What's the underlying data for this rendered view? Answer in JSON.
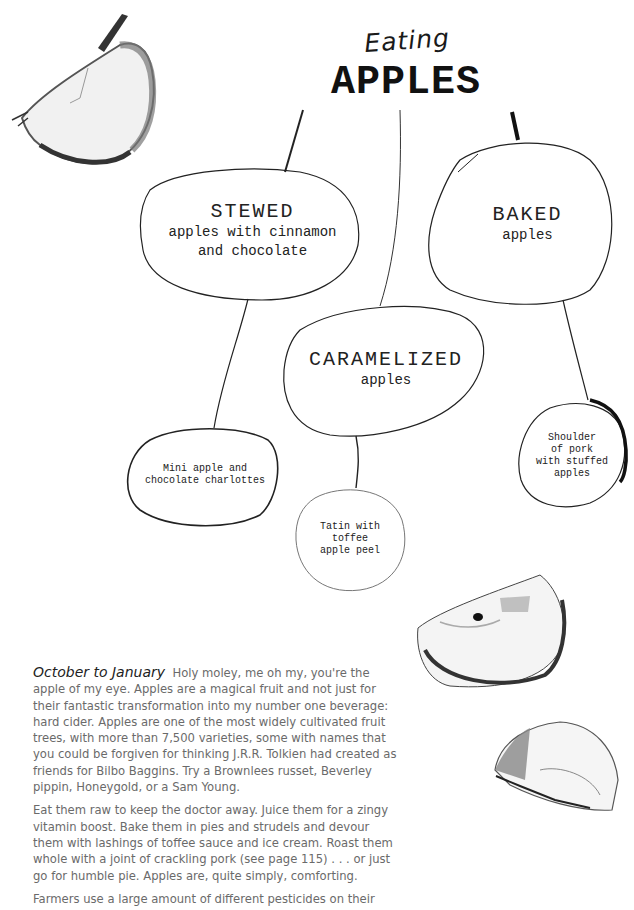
{
  "header": {
    "script": "Eating",
    "title": "APPLES"
  },
  "mindmap": {
    "stewed": {
      "title": "STEWED",
      "line1": "apples with cinnamon",
      "line2": "and chocolate"
    },
    "baked": {
      "title": "BAKED",
      "line1": "apples"
    },
    "caramelized": {
      "title": "CARAMELIZED",
      "line1": "apples"
    },
    "charlottes": {
      "line1": "Mini apple and",
      "line2": "chocolate charlottes"
    },
    "tatin": {
      "line1": "Tatin with",
      "line2": "toffee",
      "line3": "apple peel"
    },
    "pork": {
      "line1": "Shoulder",
      "line2": "of pork",
      "line3": "with stuffed",
      "line4": "apples"
    }
  },
  "article": {
    "season": "October to January",
    "para1": "Holy moley, me oh my, you're the apple of my eye. Apples are a magical fruit and not just for their fantastic transformation into my number one beverage: hard cider. Apples are one of the most widely cultivated fruit trees, with more than 7,500 varieties, some with names that you could be forgiven for thinking J.R.R. Tolkien had created as friends for Bilbo Baggins. Try a Brownlees russet, Beverley pippin, Honeygold, or a Sam Young.",
    "para2": "Eat them raw to keep the doctor away. Juice them for a zingy vitamin boost. Bake them in pies and strudels and devour them with lashings of toffee sauce and ice cream. Roast them whole with a joint of crackling pork (see page 115) . . . or just go for humble pie. Apples are, quite simply, comforting.",
    "para3": "Farmers use a large amount of different pesticides on their"
  },
  "illustrations": [
    "apple-wedge-top-left",
    "apple-slice-with-seed",
    "apple-half-bottom-right"
  ]
}
